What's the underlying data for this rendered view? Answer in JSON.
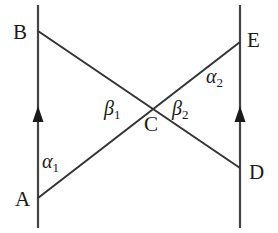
{
  "figure": {
    "width": 278,
    "height": 233,
    "background_color": "#ffffff",
    "stroke_color": "#333333",
    "text_color": "#1a1a1a"
  },
  "labels": {
    "A": "A",
    "B": "B",
    "C": "C",
    "D": "D",
    "E": "E"
  },
  "angles": {
    "alpha1": {
      "greek": "α",
      "subscript": "1"
    },
    "alpha2": {
      "greek": "α",
      "subscript": "2"
    },
    "beta1": {
      "greek": "β",
      "subscript": "1"
    },
    "beta2": {
      "greek": "β",
      "subscript": "2"
    }
  },
  "geometry": {
    "left_line": {
      "x": 38,
      "y1": 5,
      "y2": 228
    },
    "right_line": {
      "x": 240,
      "y1": 5,
      "y2": 228
    },
    "arrow_left": {
      "x": 38,
      "y": 116
    },
    "arrow_right": {
      "x": 240,
      "y": 116
    },
    "segment_BD": {
      "x1": 38,
      "y1": 31,
      "x2": 240,
      "y2": 168
    },
    "segment_AE": {
      "x1": 38,
      "y1": 198,
      "x2": 240,
      "y2": 42
    },
    "intersection_C": {
      "x": 152,
      "y": 105
    }
  }
}
